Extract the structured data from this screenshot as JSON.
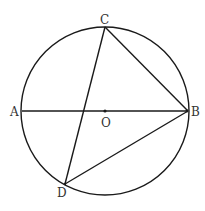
{
  "diagram": {
    "circle": {
      "center": "O",
      "cx": 105,
      "cy": 111,
      "r": 84
    },
    "points": {
      "A": {
        "label": "A",
        "x": 22,
        "y": 111
      },
      "B": {
        "label": "B",
        "x": 188,
        "y": 111
      },
      "C": {
        "label": "C",
        "x": 105,
        "y": 27
      },
      "D": {
        "label": "D",
        "x": 65,
        "y": 184
      },
      "O": {
        "label": "O",
        "x": 105,
        "y": 111
      }
    },
    "segments": [
      "AB",
      "CD",
      "CB",
      "DB"
    ],
    "stroke_color": "#1a1a1a",
    "label_color": "#333333"
  }
}
